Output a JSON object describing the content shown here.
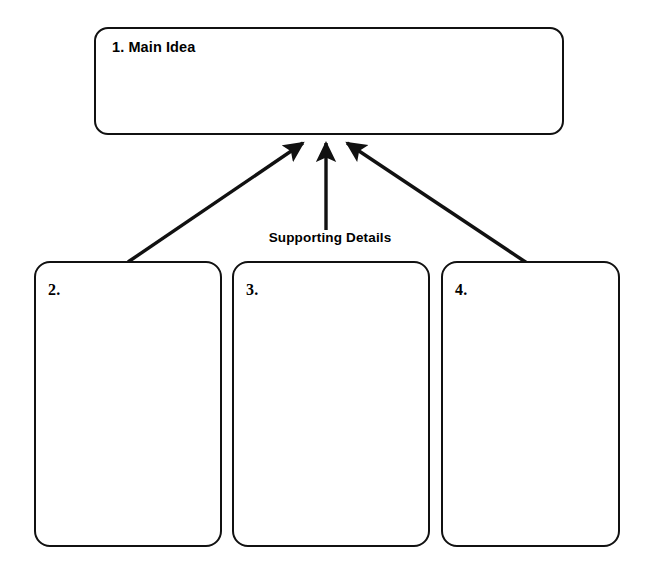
{
  "worksheet": {
    "title_box": {
      "label": "1. Main Idea",
      "content": ""
    },
    "connector_label": "Supporting Details",
    "detail_boxes": [
      {
        "label": "2.",
        "content": ""
      },
      {
        "label": "3.",
        "content": ""
      },
      {
        "label": "4.",
        "content": ""
      }
    ],
    "colors": {
      "outline": "#111111",
      "background": "#ffffff",
      "text": "#000000"
    },
    "arrows": [
      {
        "name": "arrow-from-box-2",
        "from": [
          128,
          262
        ],
        "to": [
          303,
          142
        ]
      },
      {
        "name": "arrow-from-box-3",
        "from": [
          326,
          230
        ],
        "to": [
          326,
          142
        ]
      },
      {
        "name": "arrow-from-box-4",
        "from": [
          527,
          263
        ],
        "to": [
          346,
          142
        ]
      }
    ]
  }
}
